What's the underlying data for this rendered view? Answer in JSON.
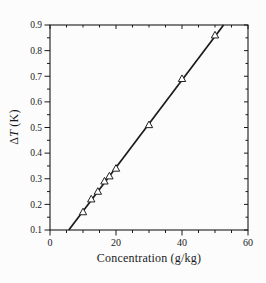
{
  "figure": {
    "background_color": "#fcfcfc",
    "ink_color": "#1a1a1a"
  },
  "chart_data": {
    "type": "scatter",
    "title": "",
    "xlabel": "Concentration (g/kg)",
    "ylabel": "ΔT (K)",
    "ylabel_parts": {
      "symbol": "Δ",
      "variable": "T",
      "unit": " (K)"
    },
    "xlim": [
      0,
      60
    ],
    "ylim": [
      0.1,
      0.9
    ],
    "x_major_ticks": [
      0,
      20,
      40,
      60
    ],
    "x_tick_labels": [
      "0",
      "20",
      "40",
      "60"
    ],
    "x_minor_step": 5,
    "y_major_ticks": [
      0.1,
      0.2,
      0.3,
      0.4,
      0.5,
      0.6,
      0.7,
      0.8,
      0.9
    ],
    "y_tick_labels": [
      "0.1",
      "0.2",
      "0.3",
      "0.4",
      "0.5",
      "0.6",
      "0.7",
      "0.8",
      "0.9"
    ],
    "y_minor_step": 0.05,
    "grid": false,
    "legend": "none",
    "series": [
      {
        "name": "measured-points",
        "marker": "open-triangle-up",
        "marker_fill": "#ffffff",
        "marker_stroke": "#222222",
        "points": [
          [
            10,
            0.17
          ],
          [
            12.5,
            0.22
          ],
          [
            14.5,
            0.25
          ],
          [
            16.5,
            0.29
          ],
          [
            18,
            0.31
          ],
          [
            20,
            0.34
          ],
          [
            30,
            0.51
          ],
          [
            40,
            0.69
          ],
          [
            50,
            0.86
          ]
        ]
      },
      {
        "name": "linear-fit-line",
        "type": "line",
        "color": "#1a1a1a",
        "endpoints": [
          [
            5.7,
            0.1
          ],
          [
            52.6,
            0.9
          ]
        ]
      }
    ]
  }
}
